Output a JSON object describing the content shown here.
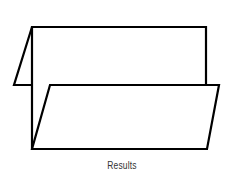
{
  "diagram": {
    "type": "folded-sheet",
    "caption": "Results",
    "stroke_color": "#000000",
    "fill_color": "#ffffff",
    "caption_color": "#333333",
    "panels": {
      "back_panel": {
        "points": "32,27 206,27 206,85 32,85"
      },
      "left_flap": {
        "points": "32,27 14,85 32,85"
      },
      "front_panel": {
        "points": "50,85 219,85 207,149 32,149"
      }
    }
  }
}
